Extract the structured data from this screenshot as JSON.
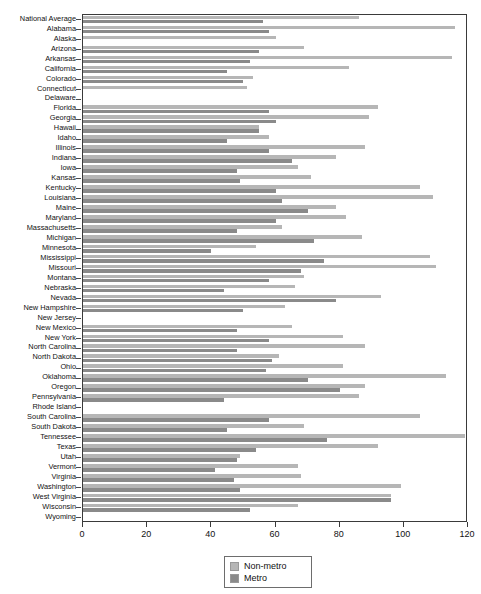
{
  "chart_data": {
    "type": "bar",
    "orientation": "horizontal",
    "title": "",
    "xlabel": "",
    "ylabel": "",
    "xlim": [
      0,
      120
    ],
    "xticks": [
      0,
      20,
      40,
      60,
      80,
      100,
      120
    ],
    "grid": false,
    "legend_position": "bottom-center",
    "colors": {
      "non_metro": "#b6b6b6",
      "metro": "#8a8a8a"
    },
    "legend": [
      "Non-metro",
      "Metro"
    ],
    "categories": [
      "National Average",
      "Alabama",
      "Alaska",
      "Arizona",
      "Arkansas",
      "California",
      "Colorado",
      "Connecticut",
      "Delaware",
      "Florida",
      "Georgia",
      "Hawaii",
      "Idaho",
      "Illinois",
      "Indiana",
      "Iowa",
      "Kansas",
      "Kentucky",
      "Louisiana",
      "Maine",
      "Maryland",
      "Massachusetts",
      "Michigan",
      "Minnesota",
      "Mississippi",
      "Missouri",
      "Montana",
      "Nebraska",
      "Nevada",
      "New Hampshire",
      "New Jersey",
      "New Mexico",
      "New York",
      "North Carolina",
      "North Dakota",
      "Ohio",
      "Oklahoma",
      "Oregon",
      "Pennsylvania",
      "Rhode Island",
      "South Carolina",
      "South Dakota",
      "Tennessee",
      "Texas",
      "Utah",
      "Vermont",
      "Virginia",
      "Washington",
      "West Virginia",
      "Wisconsin",
      "Wyoming"
    ],
    "series": [
      {
        "name": "Non-metro",
        "values": [
          86,
          116,
          60,
          69,
          115,
          83,
          53,
          51,
          0,
          92,
          89,
          55,
          58,
          88,
          79,
          67,
          71,
          105,
          109,
          79,
          82,
          62,
          87,
          54,
          108,
          110,
          69,
          66,
          93,
          63,
          0,
          65,
          81,
          88,
          61,
          81,
          113,
          88,
          86,
          0,
          105,
          69,
          119,
          92,
          49,
          67,
          68,
          99,
          96,
          67,
          0
        ]
      },
      {
        "name": "Metro",
        "values": [
          56,
          58,
          0,
          55,
          52,
          45,
          50,
          0,
          0,
          58,
          60,
          55,
          45,
          58,
          65,
          48,
          49,
          60,
          62,
          70,
          60,
          48,
          72,
          40,
          75,
          68,
          58,
          44,
          79,
          50,
          0,
          48,
          58,
          48,
          59,
          57,
          70,
          80,
          44,
          0,
          58,
          45,
          76,
          54,
          48,
          41,
          47,
          49,
          96,
          52,
          0
        ]
      }
    ]
  },
  "legend": {
    "non_metro_label": "Non-metro",
    "metro_label": "Metro"
  },
  "axis": {
    "x_tick_labels": [
      "0",
      "20",
      "40",
      "60",
      "80",
      "100",
      "120"
    ]
  }
}
